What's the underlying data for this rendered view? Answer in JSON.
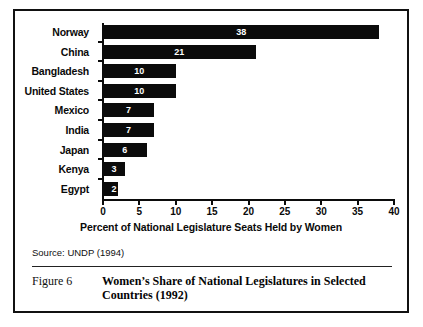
{
  "figure": {
    "number_label": "Figure 6",
    "title": "Women’s Share of National Legislatures in Selected Countries (1992)",
    "source": "Source: UNDP (1994)"
  },
  "chart_data": {
    "type": "bar",
    "orientation": "horizontal",
    "title": "",
    "subtitle": "",
    "xlabel": "Percent of National Legislature Seats Held by Women",
    "ylabel": "",
    "xlim": [
      0,
      40
    ],
    "xticks": [
      0,
      5,
      10,
      15,
      20,
      25,
      30,
      35,
      40
    ],
    "xtick_labels": [
      "0",
      "5",
      "10",
      "15",
      "20",
      "25",
      "30",
      "35",
      "40"
    ],
    "grid": false,
    "legend": false,
    "bar_color": "#0b0b0b",
    "label_color": "#ffffff",
    "categories": [
      "Norway",
      "China",
      "Bangladesh",
      "United States",
      "Mexico",
      "India",
      "Japan",
      "Kenya",
      "Egypt"
    ],
    "values": [
      38,
      21,
      10,
      10,
      7,
      7,
      6,
      3,
      2
    ],
    "value_labels": [
      "38",
      "21",
      "10",
      "10",
      "7",
      "7",
      "6",
      "3",
      "2"
    ]
  }
}
